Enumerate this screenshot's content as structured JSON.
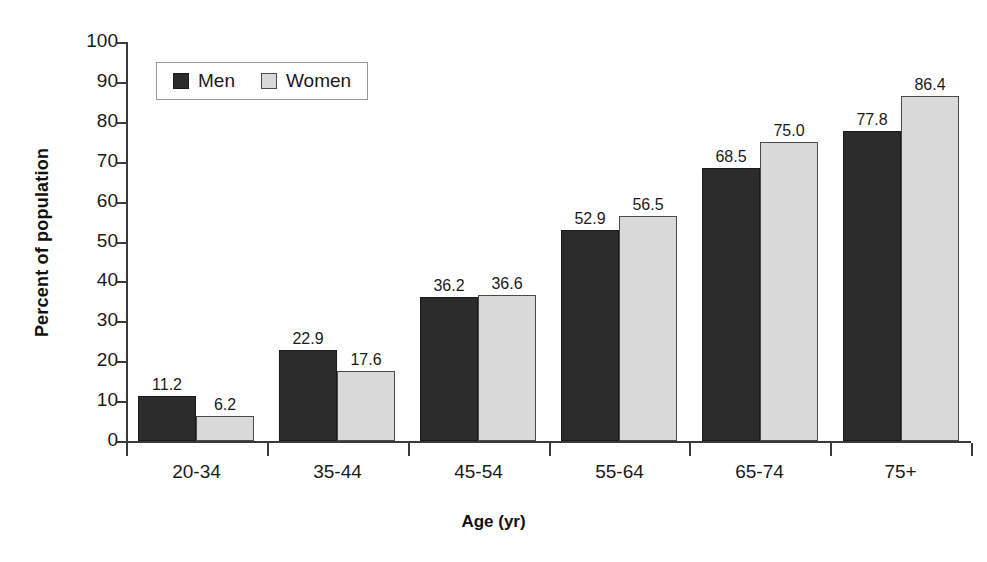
{
  "chart_data": {
    "type": "bar",
    "title": "",
    "xlabel": "Age (yr)",
    "ylabel": "Percent of population",
    "categories": [
      "20-34",
      "35-44",
      "45-54",
      "55-64",
      "65-74",
      "75+"
    ],
    "series": [
      {
        "name": "Men",
        "color": "#2c2c2c",
        "values": [
          11.2,
          22.9,
          36.2,
          52.9,
          68.5,
          77.8
        ],
        "labels": [
          "11.2",
          "22.9",
          "36.2",
          "52.9",
          "68.5",
          "77.8"
        ]
      },
      {
        "name": "Women",
        "color": "#d9d9d9",
        "values": [
          6.2,
          17.6,
          36.6,
          56.5,
          75.0,
          86.4
        ],
        "labels": [
          "6.2",
          "17.6",
          "36.6",
          "56.5",
          "75.0",
          "86.4"
        ]
      }
    ],
    "ylim": [
      0,
      100
    ],
    "yticks": [
      0,
      10,
      20,
      30,
      40,
      50,
      60,
      70,
      80,
      90,
      100
    ],
    "ytick_labels": [
      "0",
      "10",
      "20",
      "30",
      "40",
      "50",
      "60",
      "70",
      "80",
      "90",
      "100"
    ],
    "grid": false,
    "legend": {
      "position": "top-left-inside",
      "entries": [
        "Men",
        "Women"
      ]
    }
  }
}
